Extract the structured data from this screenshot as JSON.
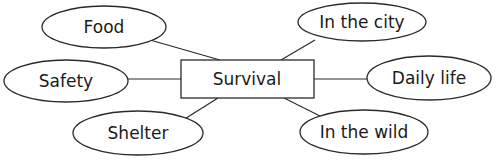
{
  "diagram": {
    "type": "mind-map",
    "center": {
      "id": "survival",
      "label": "Survival"
    },
    "branches": [
      {
        "id": "food",
        "label": "Food"
      },
      {
        "id": "in-the-city",
        "label": "In the city"
      },
      {
        "id": "safety",
        "label": "Safety"
      },
      {
        "id": "daily-life",
        "label": "Daily life"
      },
      {
        "id": "shelter",
        "label": "Shelter"
      },
      {
        "id": "in-the-wild",
        "label": "In the wild"
      }
    ],
    "edges": [
      [
        "survival",
        "food"
      ],
      [
        "survival",
        "in-the-city"
      ],
      [
        "survival",
        "safety"
      ],
      [
        "survival",
        "daily-life"
      ],
      [
        "survival",
        "shelter"
      ],
      [
        "survival",
        "in-the-wild"
      ]
    ]
  }
}
